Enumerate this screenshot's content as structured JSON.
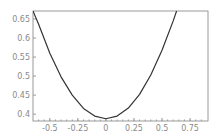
{
  "chart_data": {
    "type": "line",
    "title": "",
    "xlabel": "",
    "ylabel": "",
    "xlim": [
      -0.65,
      0.91
    ],
    "ylim": [
      0.382,
      0.671
    ],
    "grid": false,
    "legend": null,
    "x_ticks": [
      -0.5,
      -0.25,
      0,
      0.25,
      0.5,
      0.75
    ],
    "x_tick_labels": [
      "-0.5",
      "-0.25",
      "0",
      "0.25",
      "0.5",
      "0.75"
    ],
    "y_ticks": [
      0.4,
      0.45,
      0.5,
      0.55,
      0.6,
      0.65
    ],
    "y_tick_labels": [
      "0.4",
      "0.45",
      "0.5",
      "0.55",
      "0.6",
      "0.65"
    ],
    "series": [
      {
        "name": "curve",
        "color": "#333333",
        "x": [
          -0.65,
          -0.6,
          -0.5,
          -0.4,
          -0.3,
          -0.2,
          -0.1,
          0,
          0.1,
          0.2,
          0.3,
          0.4,
          0.5,
          0.6,
          0.63
        ],
        "y": [
          0.671,
          0.636,
          0.56,
          0.498,
          0.45,
          0.415,
          0.395,
          0.388,
          0.395,
          0.416,
          0.452,
          0.503,
          0.568,
          0.645,
          0.671
        ]
      }
    ]
  },
  "colors": {
    "frame": "#9a9a9a",
    "tick_label": "#8a8a8a",
    "line": "#333333"
  }
}
